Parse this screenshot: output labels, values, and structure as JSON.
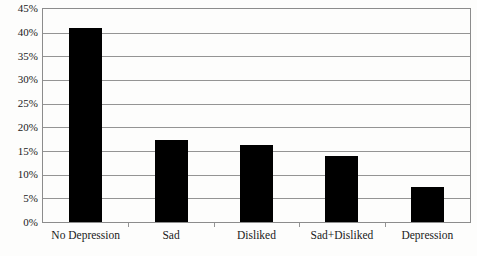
{
  "chart_data": {
    "type": "bar",
    "title": "",
    "subtitle": "",
    "xlabel": "",
    "ylabel": "",
    "categories": [
      "No Depression",
      "Sad",
      "Disliked",
      "Sad+Disliked",
      "Depression"
    ],
    "values": [
      41.0,
      17.3,
      16.3,
      14.0,
      7.4
    ],
    "series": [
      {
        "name": "",
        "values": [
          41.0,
          17.3,
          16.3,
          14.0,
          7.4
        ]
      }
    ],
    "ylim": [
      0,
      45
    ],
    "ytick_values": [
      0,
      5,
      10,
      15,
      20,
      25,
      30,
      35,
      40,
      45
    ],
    "ytick_labels": [
      "0%",
      "5%",
      "10%",
      "15%",
      "20%",
      "25%",
      "30%",
      "35%",
      "40%",
      "45%"
    ],
    "grid": true,
    "grid_axis": "y",
    "legend": false,
    "legend_position": "none",
    "annotations": [],
    "colors": {
      "bar": "#000000",
      "gridline": "#949494",
      "border": "#8c8c8c",
      "background": "#fdfdfc",
      "text": "#1a1a1a"
    }
  }
}
